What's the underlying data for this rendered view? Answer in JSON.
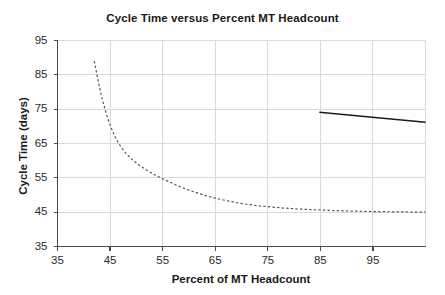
{
  "chart_data": {
    "type": "line",
    "title": "Cycle Time versus Percent MT Headcount",
    "xlabel": "Percent of MT Headcount",
    "ylabel": "Cycle Time (days)",
    "xlim": [
      35,
      105
    ],
    "ylim": [
      35,
      95
    ],
    "xticks": [
      35,
      45,
      55,
      65,
      75,
      85,
      95
    ],
    "yticks": [
      35,
      45,
      55,
      65,
      75,
      85,
      95
    ],
    "xtick_labels": [
      "35",
      "45",
      "55",
      "65",
      "75",
      "85",
      "95"
    ],
    "ytick_labels": [
      "35",
      "45",
      "55",
      "65",
      "75",
      "85",
      "95"
    ],
    "grid": true,
    "grid_color": "#d9d9d9",
    "legend": null,
    "series": [
      {
        "name": "Modeled cycle time curve",
        "style": "dashed",
        "color": "#555555",
        "x": [
          42.0,
          42.5,
          43.0,
          43.5,
          44.0,
          44.5,
          45.0,
          45.5,
          46.0,
          46.5,
          47.0,
          48.0,
          49.0,
          50.0,
          51.0,
          52.0,
          53.0,
          54.0,
          55.0,
          56.0,
          57.0,
          58.0,
          59.0,
          60.0,
          61.0,
          62.0,
          63.0,
          64.0,
          65.0,
          67.0,
          69.0,
          71.0,
          73.0,
          75.0,
          78.0,
          81.0,
          84.0,
          87.0,
          90.0,
          93.0,
          96.0,
          99.0,
          102.0,
          105.0
        ],
        "y": [
          89.0,
          85.0,
          81.3,
          78.0,
          75.2,
          72.6,
          70.4,
          68.5,
          66.8,
          65.4,
          64.2,
          62.2,
          60.6,
          59.3,
          58.2,
          57.2,
          56.3,
          55.5,
          54.7,
          54.0,
          53.3,
          52.6,
          52.0,
          51.4,
          50.9,
          50.4,
          49.9,
          49.5,
          49.1,
          48.4,
          47.8,
          47.3,
          46.9,
          46.6,
          46.2,
          45.9,
          45.7,
          45.5,
          45.35,
          45.25,
          45.15,
          45.1,
          45.05,
          45.0
        ]
      },
      {
        "name": "Reference trend segment",
        "style": "solid",
        "color": "#1a1a1a",
        "x": [
          84.8,
          105.0
        ],
        "y": [
          74.1,
          71.2
        ]
      }
    ]
  },
  "chart_meta": {
    "title_text": "Cycle Time versus Percent MT Headcount",
    "x_axis_title": "Percent of MT Headcount",
    "y_axis_title": "Cycle Time (days)"
  }
}
